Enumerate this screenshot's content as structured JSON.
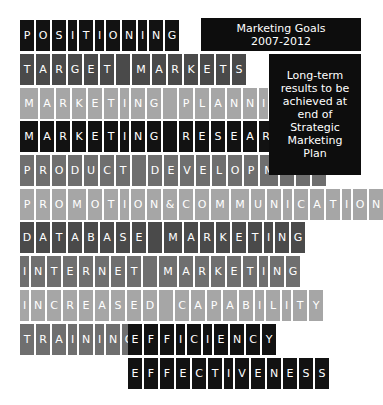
{
  "title_box": {
    "line1": "Marketing Goals",
    "line2": "2007-2012"
  },
  "side_box": {
    "lines": [
      "Long-term",
      "results to be",
      "achieved at",
      "end of",
      "Strategic",
      "Marketing",
      "Plan"
    ]
  },
  "colors": {
    "black": "#121212",
    "dark": "#4a4a4a",
    "mid": "#6f6f6f",
    "light": "#a6a6a6",
    "text": "#ffffff"
  },
  "rows": [
    {
      "text": "POSITIONING",
      "shade": "black",
      "top": 20,
      "left": 20
    },
    {
      "text": "TARGET MARKETS",
      "shade": "dark",
      "top": 54,
      "left": 20
    },
    {
      "text": "MARKETING PLANNING",
      "shade": "light",
      "top": 88,
      "left": 20
    },
    {
      "text": "MARKETING RESEARCH",
      "shade": "black",
      "top": 121,
      "left": 20
    },
    {
      "text": "PRODUCT DEVELOPMENT",
      "shade": "mid",
      "top": 155,
      "left": 20
    },
    {
      "text": "PROMOTION&COMMUNICATION",
      "shade": "light",
      "top": 189,
      "left": 20
    },
    {
      "text": "DATABASE MARKETING",
      "shade": "dark",
      "top": 222,
      "left": 20
    },
    {
      "text": "INTERNET MARKETING",
      "shade": "mid",
      "top": 256,
      "left": 20
    },
    {
      "text": "INCREASED CAPABILITY",
      "shade": "light",
      "top": 290,
      "left": 20
    },
    {
      "text": "TRAINING",
      "shade": "mid",
      "top": 324,
      "left": 20
    },
    {
      "text": "EFFICIENCY",
      "shade": "black",
      "top": 324,
      "left": 128
    },
    {
      "text": "EFFECTIVENESS",
      "shade": "black",
      "top": 358,
      "left": 128
    }
  ]
}
